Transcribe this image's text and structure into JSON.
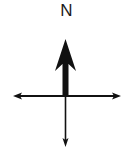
{
  "compass": {
    "north_label": "N",
    "stroke_color": "#111111",
    "background": "#ffffff"
  }
}
